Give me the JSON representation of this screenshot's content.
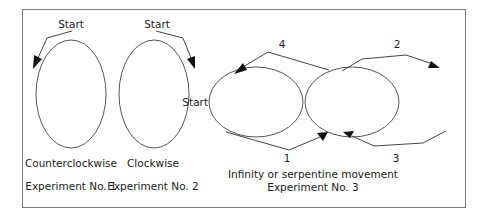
{
  "figure": {
    "frame_color": "#7a7a7a",
    "experiments": [
      {
        "start_label": "Start",
        "direction": "Counterclockwise",
        "caption": "Experiment No. 1"
      },
      {
        "start_label": "Start",
        "direction": "Clockwise",
        "caption": "Experiment No. 2"
      },
      {
        "start_label": "Start",
        "direction": "Infinity or serpentine movement",
        "caption": "Experiment No. 3",
        "steps": [
          "1",
          "2",
          "3",
          "4"
        ]
      }
    ]
  }
}
